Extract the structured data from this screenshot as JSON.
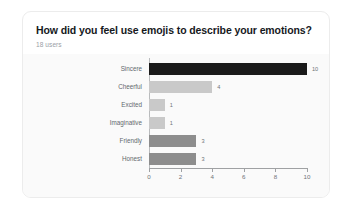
{
  "card": {
    "title": "How did you feel use emojis to describe your emotions?",
    "subtitle": "18 users"
  },
  "colors": {
    "page_background": "#ffffff",
    "card_background": "#ffffff",
    "card_border": "#ececec",
    "plot_background": "#fafafa",
    "bar_dark": "#1a1a1a",
    "bar_light": "#c9c9c9",
    "bar_medium": "#8d8d8d",
    "axis": "#9fa1a3",
    "title_text": "#16191d",
    "subtitle_text": "#9aa0a6",
    "tick_text": "#6f7479"
  },
  "chart_data": {
    "type": "bar",
    "orientation": "horizontal",
    "title": "How did you feel use emojis to describe your emotions?",
    "subtitle": "18 users",
    "xlabel": "",
    "ylabel": "",
    "xlim": [
      0,
      10
    ],
    "grid": false,
    "legend": "none",
    "xticks": [
      0,
      2,
      4,
      6,
      8,
      10
    ],
    "xticklabels": [
      "0",
      "2",
      "4",
      "6",
      "8",
      "10"
    ],
    "categories": [
      "Sincere",
      "Cheerful",
      "Excited",
      "Imaginative",
      "Friendly",
      "Honest"
    ],
    "values": [
      10,
      4,
      1,
      1,
      3,
      3
    ],
    "data_labels": [
      "10",
      "4",
      "1",
      "1",
      "3",
      "3"
    ],
    "bar_colors": [
      "#1a1a1a",
      "#c9c9c9",
      "#c9c9c9",
      "#c9c9c9",
      "#8d8d8d",
      "#8d8d8d"
    ]
  }
}
